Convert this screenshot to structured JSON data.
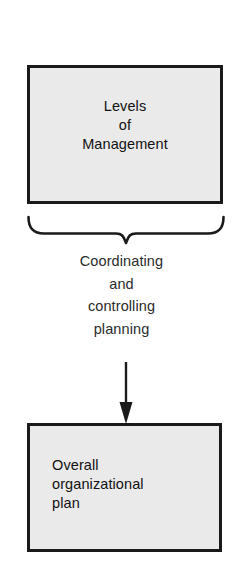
{
  "diagram": {
    "canvas": {
      "width": 243,
      "height": 566,
      "background": "#ffffff"
    },
    "style": {
      "box_fill": "#eaeaea",
      "box_border": "#1a1a1a",
      "text_color": "#111111",
      "caption_color": "#2b2b2b",
      "connector_color": "#1a1a1a"
    },
    "top_box": {
      "name": "levels-of-management",
      "lines": [
        "Levels",
        "of",
        "Management"
      ],
      "line_1": "Levels",
      "line_2": "of",
      "line_3": "Management",
      "align": "center"
    },
    "brace": {
      "name": "curly-brace",
      "orientation": "down",
      "label": "brace grouping levels of management"
    },
    "caption": {
      "name": "coordinating-and-controlling-planning",
      "lines": [
        "Coordinating",
        "and",
        "controlling",
        "planning"
      ],
      "line_1": "Coordinating",
      "line_2": "and",
      "line_3": "controlling",
      "line_4": "planning",
      "align": "center"
    },
    "arrow": {
      "name": "flow-arrow",
      "direction": "down"
    },
    "bottom_box": {
      "name": "overall-organizational-plan",
      "lines": [
        "Overall",
        "organizational",
        "plan"
      ],
      "line_1": "Overall",
      "line_2": "organizational",
      "line_3": "plan",
      "align": "left"
    }
  }
}
